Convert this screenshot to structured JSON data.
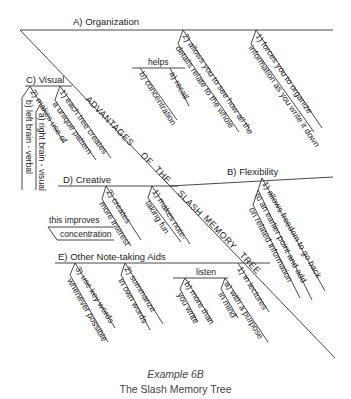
{
  "diagram": {
    "trunk_text": [
      "ADVANTAGES",
      "OF",
      "THE",
      "SLASH",
      "MEMORY",
      "TREE"
    ],
    "branches": {
      "A": {
        "label": "A) Organization",
        "items": [
          {
            "line1": "1) forces you to organize",
            "line2": "information as you write it down"
          },
          {
            "line1": "2) allows you to see how all the",
            "line2": "details relate to the whole"
          }
        ],
        "sub_label": "helps",
        "sub_items": [
          "a) recall",
          "b) concentration"
        ]
      },
      "B": {
        "label": "B) Flexibility",
        "items": [
          {
            "line1": "1) allows freedom to go back",
            "line2": "to an earlier point and add",
            "line3": "on related information"
          }
        ]
      },
      "C": {
        "label": "C) Visual",
        "items": [
          {
            "line1": "1) each tree creates",
            "line2": "a unique pattern"
          },
          {
            "line1": "2) makes use of"
          }
        ],
        "sub_items": [
          "a) right brain - visual",
          "b) left brain - verbal"
        ]
      },
      "D": {
        "label": "D) Creative",
        "items": [
          {
            "line1": "1) makes note-",
            "line2": "taking fun"
          },
          {
            "line1": "2) creates",
            "line2": "more interest"
          }
        ],
        "sub_label": "this improves",
        "sub_item": "concentration"
      },
      "E": {
        "label": "E) Other Note-taking Aids",
        "items": [
          {
            "line1": "1) in lectures"
          },
          {
            "line1": "2) summarize",
            "line2": "in own words"
          },
          {
            "line1": "3) use key words",
            "line2": "whenever possible"
          }
        ],
        "sub_label": "listen",
        "sub_items": [
          {
            "line1": "a) with a purpose",
            "line2": "in mind"
          },
          {
            "line1": "b) more than",
            "line2": "you write"
          }
        ]
      }
    }
  },
  "caption": {
    "title": "Example 6B",
    "subtitle": "The Slash Memory Tree"
  }
}
